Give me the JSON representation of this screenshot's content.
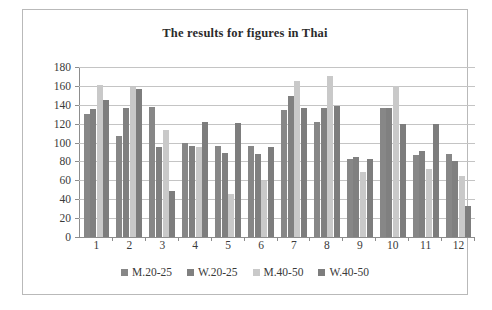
{
  "chart_data": {
    "type": "bar",
    "title": "The results for figures in Thai",
    "xlabel": "",
    "ylabel": "",
    "ylim": [
      0,
      180
    ],
    "ytick_step": 20,
    "yticks": [
      180,
      160,
      140,
      120,
      100,
      80,
      60,
      40,
      20,
      0
    ],
    "grid": true,
    "legend_position": "bottom",
    "categories": [
      "1",
      "2",
      "3",
      "4",
      "5",
      "6",
      "7",
      "8",
      "9",
      "10",
      "11",
      "12"
    ],
    "series": [
      {
        "name": "M.20-25",
        "color": "#878787",
        "values": [
          130,
          107,
          138,
          100,
          96,
          96,
          135,
          122,
          83,
          137,
          87,
          88
        ]
      },
      {
        "name": "W.20-25",
        "color": "#808080",
        "values": [
          136,
          137,
          95,
          96,
          89,
          88,
          149,
          137,
          85,
          137,
          91,
          80
        ]
      },
      {
        "name": "M.40-50",
        "color": "#c9c9c9",
        "values": [
          161,
          159,
          113,
          95,
          46,
          59,
          165,
          170,
          69,
          160,
          72,
          65
        ]
      },
      {
        "name": "W.40-50",
        "color": "#7d7d7d",
        "values": [
          145,
          157,
          49,
          122,
          121,
          95,
          137,
          139,
          83,
          120,
          120,
          33
        ]
      }
    ]
  }
}
